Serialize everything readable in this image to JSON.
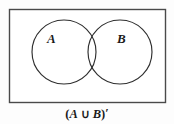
{
  "figure": {
    "type": "venn-diagram",
    "background_color": "#fdfdfd",
    "stroke_color": "#3a3a3a",
    "text_color": "#1a1a1a"
  },
  "universal_set": {
    "name": "universal-set-rectangle",
    "x": 9,
    "y": 9,
    "width": 157,
    "height": 94
  },
  "sets": [
    {
      "id": "set-a",
      "label": "A",
      "cx": 64,
      "cy": 52,
      "r": 32
    },
    {
      "id": "set-b",
      "label": "B",
      "cx": 120,
      "cy": 52,
      "r": 32
    }
  ],
  "caption": {
    "full_text": "(A ∪ B)'",
    "open_paren": "(",
    "left_operand": "A",
    "operator": "∪",
    "right_operand": "B",
    "close_paren": ")",
    "prime": "′"
  }
}
